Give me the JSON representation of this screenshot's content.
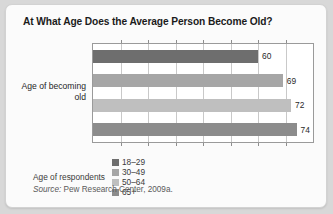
{
  "card": {
    "title": "At What Age Does the Average Person Become Old?"
  },
  "chart_data": {
    "type": "bar",
    "orientation": "horizontal",
    "title": "At What Age Does the Average Person Become Old?",
    "xlabel": "",
    "ylabel": "Age of becoming old",
    "categories": [
      "18–29",
      "30–49",
      "50–64",
      "65+"
    ],
    "values": [
      60,
      69,
      72,
      74
    ],
    "value_labels": [
      "60",
      "69",
      "72",
      "74"
    ],
    "colors": [
      "#6e6e6e",
      "#a6a6a6",
      "#bfbfbf",
      "#8c8c8c"
    ],
    "xlim": [
      0,
      80
    ],
    "gridline_values": [
      10,
      20,
      30,
      40,
      50,
      60,
      70
    ],
    "grid": true,
    "legend_position": "bottom"
  },
  "legend": {
    "title": "Age of respondents",
    "items": [
      {
        "label": "18–29",
        "color": "#6e6e6e"
      },
      {
        "label": "30–49",
        "color": "#a6a6a6"
      },
      {
        "label": "50–64",
        "color": "#bfbfbf"
      },
      {
        "label": "65+",
        "color": "#8c8c8c"
      }
    ]
  },
  "source": {
    "prefix": "Source:",
    "text": " Pew Research Center, 2009a."
  }
}
